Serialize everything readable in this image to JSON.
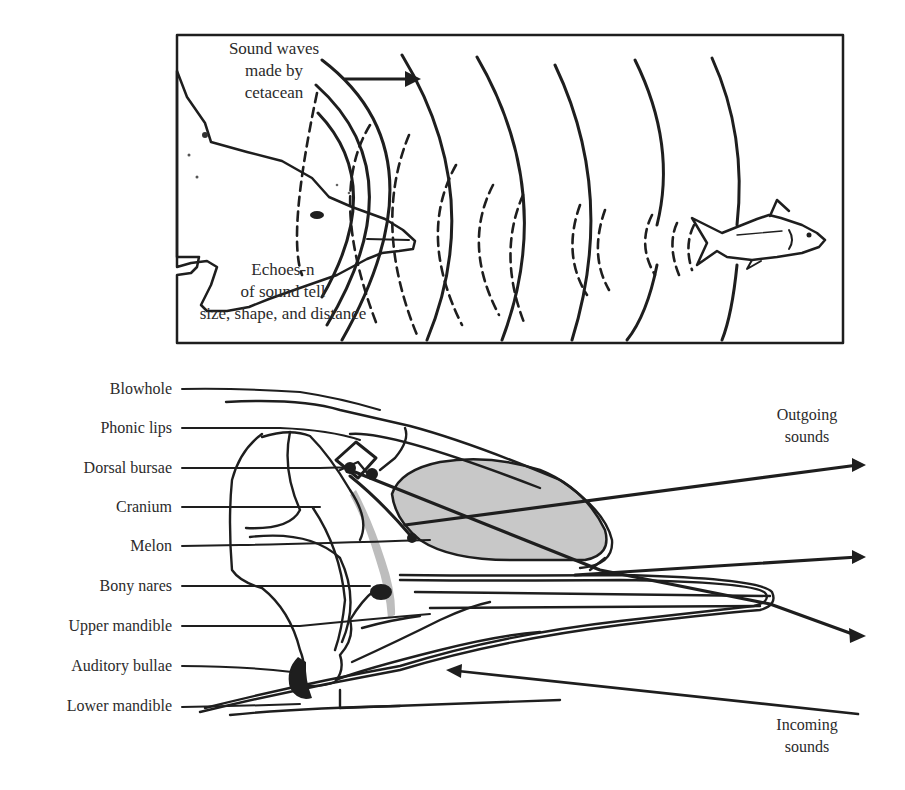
{
  "echolocation_panel": {
    "emitted_label_lines": [
      "Sound waves",
      "made by",
      "cetacean"
    ],
    "echo_label_lines": [
      "Echoes-n",
      "of sound tell",
      "size, shape, and distance"
    ],
    "background_color": "#f0f0f0",
    "figures": [
      "dolphin-head",
      "fish",
      "outgoing-solid-wave-arcs",
      "returning-dashed-echo-arcs"
    ]
  },
  "anatomy_panel": {
    "part_labels": [
      "Blowhole",
      "Phonic lips",
      "Dorsal bursae",
      "Cranium",
      "Melon",
      "Bony nares",
      "Upper mandible",
      "Auditory bullae",
      "Lower mandible"
    ],
    "outgoing_label_lines": [
      "Outgoing",
      "sounds"
    ],
    "incoming_label_lines": [
      "Incoming",
      "sounds"
    ],
    "melon_color": "#c8c8c8",
    "outgoing_arrow_count": 3,
    "incoming_arrow_count": 1
  }
}
